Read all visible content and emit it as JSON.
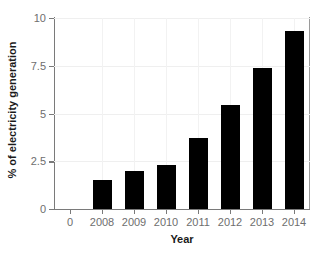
{
  "chart_data": {
    "type": "bar",
    "title": "",
    "subtitle": "",
    "xlabel": "Year",
    "ylabel": "% of electricity generation",
    "categories": [
      "2008",
      "2009",
      "2010",
      "2011",
      "2012",
      "2013",
      "2014"
    ],
    "values": [
      1.5,
      2.0,
      2.3,
      3.7,
      5.45,
      7.4,
      9.3
    ],
    "series": [
      {
        "name": "% of electricity generation",
        "values": [
          1.5,
          2.0,
          2.3,
          3.7,
          5.45,
          7.4,
          9.3
        ]
      }
    ],
    "ylim": [
      0,
      10
    ],
    "yticks": [
      0,
      2.5,
      5,
      7.5,
      10
    ],
    "ytick_labels": [
      "0",
      "2.5",
      "5",
      "7.5",
      "10"
    ],
    "xtick_labels": [
      "0",
      "2008",
      "2009",
      "2010",
      "2011",
      "2012",
      "2013",
      "2014"
    ],
    "x_origin_label": "0",
    "grid": true,
    "grid_axis": "both",
    "legend": false,
    "legend_position": "none",
    "bar_color": "#000000",
    "grid_color": "#efefef",
    "axis_color": "#7a7a7a",
    "tick_label_color": "#6e6e6e",
    "axis_title_color": "#1a1a1a",
    "background_color": "#ffffff"
  }
}
